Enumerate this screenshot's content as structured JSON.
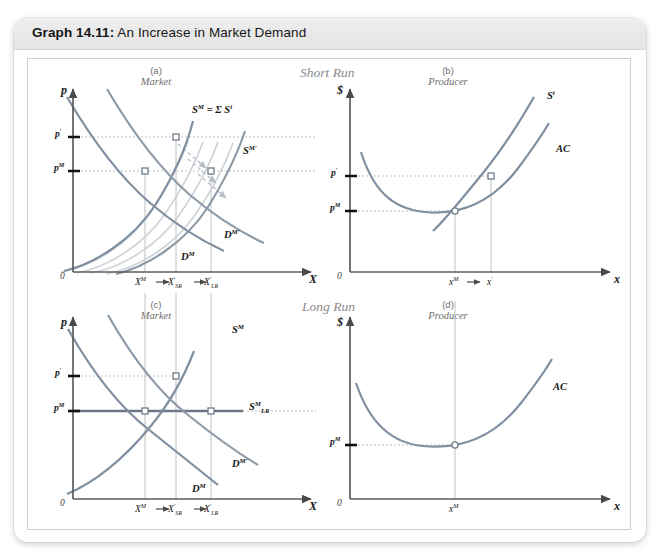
{
  "header": {
    "graph_number": "Graph 14.11:",
    "graph_title": " An Increase in Market Demand"
  },
  "section_labels": {
    "short_run": "Short Run",
    "long_run": "Long Run"
  },
  "panels": {
    "a": {
      "tag": "(a)",
      "subtitle": "Market",
      "y_axis": "p",
      "x_axis": "X",
      "origin": "0",
      "y_ticks": [
        "p′",
        "pᴹ"
      ],
      "x_ticks": [
        "Xᴹ",
        "X′SR",
        "X′LR"
      ],
      "curves": [
        {
          "name": "supply-market",
          "label": "Sᴹ = Σ Sⁱ"
        },
        {
          "name": "supply-market-prime",
          "label": "Sᴹ′"
        },
        {
          "name": "demand-market",
          "label": "Dᴹ"
        },
        {
          "name": "demand-market-prime",
          "label": "Dᴹ′"
        }
      ]
    },
    "b": {
      "tag": "(b)",
      "subtitle": "Producer",
      "y_axis": "$",
      "x_axis": "x",
      "origin": "0",
      "y_ticks": [
        "p′",
        "pᴹ"
      ],
      "x_ticks": [
        "xᴹ",
        "x′"
      ],
      "curves": [
        {
          "name": "supply-firm",
          "label": "Sⁱ"
        },
        {
          "name": "average-cost",
          "label": "AC"
        }
      ]
    },
    "c": {
      "tag": "(c)",
      "subtitle": "Market",
      "y_axis": "p",
      "x_axis": "X",
      "origin": "0",
      "y_ticks": [
        "p′",
        "pᴹ"
      ],
      "x_ticks": [
        "Xᴹ",
        "X′SR",
        "X′LR"
      ],
      "curves": [
        {
          "name": "supply-market",
          "label": "Sᴹ"
        },
        {
          "name": "supply-market-longrun",
          "label": "SᴹLR"
        },
        {
          "name": "demand-market",
          "label": "Dᴹ"
        },
        {
          "name": "demand-market-prime",
          "label": "Dᴹ′"
        }
      ]
    },
    "d": {
      "tag": "(d)",
      "subtitle": "Producer",
      "y_axis": "$",
      "x_axis": "x",
      "origin": "0",
      "y_ticks": [
        "pᴹ"
      ],
      "x_ticks": [
        "xᴹ"
      ],
      "curves": [
        {
          "name": "average-cost",
          "label": "AC"
        }
      ]
    }
  },
  "colors": {
    "curve": "#7f8fa0",
    "curve_light": "#c9ced6",
    "guide": "#b9b9b9",
    "axis": "#5c5c5c",
    "header_bg": "#e8e8e8",
    "frame": "#cfcfcf"
  }
}
